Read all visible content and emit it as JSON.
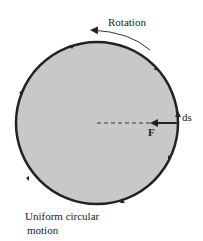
{
  "diagram": {
    "rotation_label": "Rotation",
    "force_label": "F",
    "displacement_label": "ds",
    "caption_line1": "Uniform circular",
    "caption_line2": "motion"
  },
  "colors": {
    "disk_fill": "#c8c8c8",
    "stroke": "#222222",
    "background": "#ffffff"
  }
}
